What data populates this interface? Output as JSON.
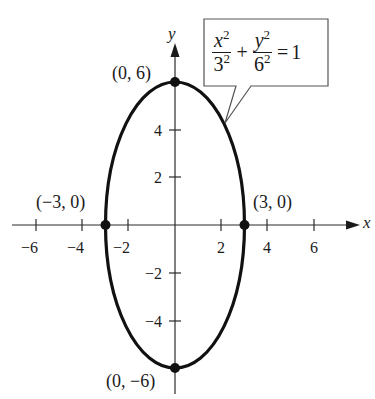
{
  "figure": {
    "type": "ellipse-graph",
    "equation": {
      "term1": {
        "num_var": "x",
        "num_exp": "2",
        "den_base": "3",
        "den_exp": "2"
      },
      "op_plus": "+",
      "term2": {
        "num_var": "y",
        "num_exp": "2",
        "den_base": "6",
        "den_exp": "2"
      },
      "op_eq": "=",
      "rhs": "1"
    },
    "axes": {
      "x_label": "x",
      "y_label": "y",
      "x_ticks": [
        "−6",
        "−4",
        "−2",
        "2",
        "4",
        "6"
      ],
      "y_ticks": [
        "6_unlabeled",
        "4",
        "2",
        "−2",
        "−4"
      ],
      "y_tick_labels": [
        "4",
        "2",
        "−2",
        "−4"
      ]
    },
    "points": [
      {
        "label": "(0, 6)",
        "x": 0,
        "y": 6
      },
      {
        "label": "(−3, 0)",
        "x": -3,
        "y": 0
      },
      {
        "label": "(3, 0)",
        "x": 3,
        "y": 0
      },
      {
        "label": "(0, −6)",
        "x": 0,
        "y": -6
      }
    ],
    "ellipse": {
      "center": [
        0,
        0
      ],
      "a": 3,
      "b": 6
    },
    "colors": {
      "ink": "#1a1a1a",
      "axis": "#2a2a2a",
      "callout_border": "#555555"
    }
  }
}
